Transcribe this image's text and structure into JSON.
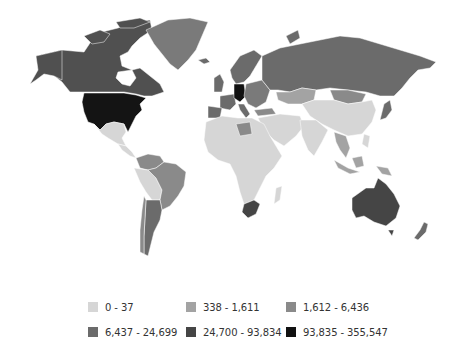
{
  "map": {
    "type": "choropleth",
    "projection": "world",
    "background_color": "#ffffff",
    "regions": [
      {
        "name": "United States",
        "class": 6
      },
      {
        "name": "Canada",
        "class": 5
      },
      {
        "name": "Greenland",
        "class": 4
      },
      {
        "name": "Mexico",
        "class": 1
      },
      {
        "name": "Central America & Caribbean",
        "class": 1
      },
      {
        "name": "Brazil",
        "class": 3
      },
      {
        "name": "Argentina",
        "class": 4
      },
      {
        "name": "Chile",
        "class": 3
      },
      {
        "name": "Colombia / Venezuela",
        "class": 3
      },
      {
        "name": "Peru / Bolivia / Paraguay",
        "class": 1
      },
      {
        "name": "Germany",
        "class": 6
      },
      {
        "name": "France",
        "class": 4
      },
      {
        "name": "United Kingdom",
        "class": 4
      },
      {
        "name": "Scandinavia",
        "class": 4
      },
      {
        "name": "Eastern Europe",
        "class": 3
      },
      {
        "name": "Russia",
        "class": 4
      },
      {
        "name": "Kazakhstan",
        "class": 2
      },
      {
        "name": "Mongolia",
        "class": 3
      },
      {
        "name": "China",
        "class": 1
      },
      {
        "name": "Middle East",
        "class": 1
      },
      {
        "name": "Turkey",
        "class": 3
      },
      {
        "name": "India",
        "class": 1
      },
      {
        "name": "Japan",
        "class": 4
      },
      {
        "name": "Southeast Asia",
        "class": 2
      },
      {
        "name": "Indonesia",
        "class": 2
      },
      {
        "name": "Africa (most)",
        "class": 1
      },
      {
        "name": "Libya",
        "class": 3
      },
      {
        "name": "South Africa",
        "class": 5
      },
      {
        "name": "Madagascar",
        "class": 1
      },
      {
        "name": "Australia",
        "class": 5
      },
      {
        "name": "New Zealand",
        "class": 4
      }
    ]
  },
  "legend": {
    "items": [
      {
        "label": "0 - 37",
        "color": "#d6d6d6",
        "class": 1
      },
      {
        "label": "338 - 1,611",
        "color": "#a3a3a3",
        "class": 2
      },
      {
        "label": "1,612 - 6,436",
        "color": "#8a8a8a",
        "class": 3
      },
      {
        "label": "6,437 - 24,699",
        "color": "#6b6b6b",
        "class": 4
      },
      {
        "label": "24,700 - 93,834",
        "color": "#454545",
        "class": 5
      },
      {
        "label": "93,835 - 355,547",
        "color": "#111111",
        "class": 6
      }
    ]
  }
}
